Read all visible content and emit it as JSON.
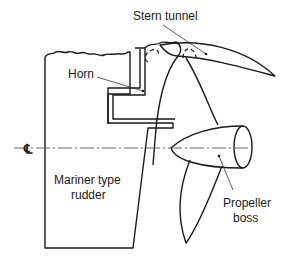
{
  "diagram": {
    "labels": {
      "stern_tunnel": "Stern tunnel",
      "horn": "Horn",
      "centerline_symbol": "℄",
      "rudder_line1": "Mariner type",
      "rudder_line2": "rudder",
      "boss_line1": "Propeller",
      "boss_line2": "boss"
    },
    "colors": {
      "line": "#1a1a1a",
      "background": "#ffffff"
    }
  }
}
